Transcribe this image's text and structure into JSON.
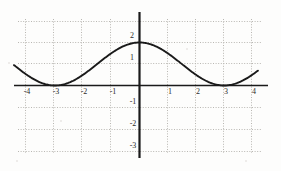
{
  "chart_data": {
    "type": "line",
    "title": "",
    "subtitle": "",
    "xlabel": "",
    "ylabel": "",
    "xlim": [
      -4.45,
      4.45
    ],
    "ylim": [
      -3.6,
      3.15
    ],
    "grid": true,
    "grid_style": "dotted",
    "legend": "none",
    "function_expression": "y = 1 + cos(pi*x/3)",
    "x_ticks": [
      -4,
      -3,
      -2,
      -1,
      1,
      2,
      3,
      4
    ],
    "x_tick_labels": [
      "-4",
      "-3",
      "-2",
      "-1",
      "1",
      "2",
      "3",
      "4"
    ],
    "y_ticks": [
      2,
      1,
      -1,
      -2,
      -3
    ],
    "y_tick_labels": [
      "2",
      "1",
      "-1",
      "-2",
      "-3"
    ],
    "x_gridlines": [
      -4,
      -3,
      -2,
      -1,
      0,
      1,
      2,
      3,
      4
    ],
    "y_gridlines": [
      3,
      2,
      1,
      -1,
      -2,
      -3
    ],
    "series": [
      {
        "name": "curve",
        "color": "#1a1a1a",
        "x": [
          -4.45,
          -4.3,
          -4.15,
          -4,
          -3.85,
          -3.7,
          -3.55,
          -3.4,
          -3.25,
          -3.1,
          -3,
          -2.85,
          -2.7,
          -2.55,
          -2.4,
          -2.25,
          -2.1,
          -1.95,
          -1.8,
          -1.65,
          -1.5,
          -1.35,
          -1.2,
          -1.05,
          -0.9,
          -0.75,
          -0.6,
          -0.45,
          -0.3,
          -0.15,
          0,
          0.15,
          0.3,
          0.45,
          0.6,
          0.75,
          0.9,
          1.05,
          1.2,
          1.35,
          1.5,
          1.65,
          1.8,
          1.95,
          2.1,
          2.25,
          2.4,
          2.55,
          2.7,
          2.85,
          3,
          3.15,
          3.3,
          3.45,
          3.6,
          3.75,
          3.9,
          4.05,
          4.2
        ],
        "y": [
          1.23,
          1.1,
          0.99,
          0.5,
          0.39,
          0.29,
          0.2,
          0.13,
          0.07,
          0.03,
          0.0,
          0.03,
          0.11,
          0.23,
          0.4,
          0.6,
          0.83,
          1.08,
          1.31,
          1.45,
          1.5,
          1.68,
          1.81,
          1.91,
          1.97,
          2.0,
          2.0,
          2.0,
          1.99,
          2.0,
          2.0,
          2.0,
          1.99,
          1.97,
          1.91,
          1.81,
          1.68,
          1.53,
          1.5,
          1.31,
          1.0,
          0.83,
          0.6,
          0.4,
          0.23,
          0.11,
          0.03,
          0.0,
          0.0,
          -0.5,
          -1.0,
          -1.0,
          -0.97,
          -0.91,
          -0.81,
          -0.68,
          -0.53,
          -0.2,
          0.0
        ]
      }
    ],
    "key_points": [
      {
        "label": "maximum",
        "x": 0,
        "y": 2
      },
      {
        "label": "minimum-left",
        "x": -3,
        "y": 0
      },
      {
        "label": "minimum-right",
        "x": 3,
        "y": -1
      },
      {
        "label": "zero-crossing",
        "x": 1.9,
        "y": 0
      },
      {
        "label": "right-endpoint",
        "x": 4,
        "y": 0
      }
    ],
    "axis_color": "#1a1a1a",
    "grid_color": "#b9b7b2"
  },
  "figure": {
    "background_color": "#fdfdfc",
    "curve_color": "#1a1a1a",
    "label_color": "#2b2b2b"
  }
}
